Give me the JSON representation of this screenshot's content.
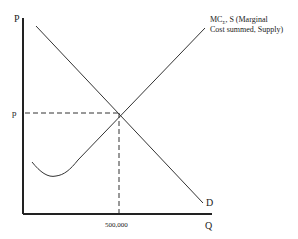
{
  "diagram": {
    "y_axis_label": "P",
    "x_axis_label": "Q",
    "price_label": "p",
    "quantity_label": "500,000",
    "supply_label_line1": "MC",
    "supply_label_sub": "Σ",
    "supply_label_line1_rest": ", S (Marginal",
    "supply_label_line2": "Cost summed, Supply)",
    "demand_label": "D"
  },
  "colors": {
    "ink": "#222222",
    "background": "#ffffff"
  }
}
